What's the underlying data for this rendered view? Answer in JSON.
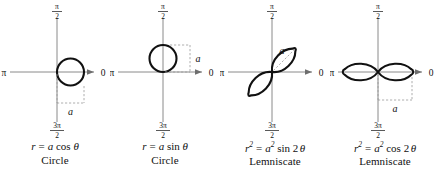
{
  "figure": {
    "background_color": "#ffffff",
    "curve_color": "#111111",
    "axis_color": "#8a8a8a",
    "dimension_color": "#9a9a9a"
  },
  "axis_labels": {
    "right": "0",
    "left": "π",
    "top_numerator": "π",
    "top_denominator": "2",
    "bottom_numerator": "3π",
    "bottom_denominator": "2",
    "dimension": "a"
  },
  "panels": [
    {
      "id": "circle-cos",
      "equation_plain": "r = a cos θ",
      "equation": {
        "lhs": "r",
        "lhs_exp": "",
        "equals": "=",
        "coef": "a",
        "coef_exp": "",
        "func": "cos",
        "arg": "θ",
        "multiplier": ""
      },
      "name": "Circle",
      "curve_type": "circle",
      "orientation": "right",
      "dimension_label": "a",
      "dimension_placement": "below-horizontal"
    },
    {
      "id": "circle-sin",
      "equation_plain": "r = a sin θ",
      "equation": {
        "lhs": "r",
        "lhs_exp": "",
        "equals": "=",
        "coef": "a",
        "coef_exp": "",
        "func": "sin",
        "arg": "θ",
        "multiplier": ""
      },
      "name": "Circle",
      "curve_type": "circle",
      "orientation": "up",
      "dimension_label": "a",
      "dimension_placement": "right-vertical"
    },
    {
      "id": "lemniscate-sin",
      "equation_plain": "r² = a² sin 2θ",
      "equation": {
        "lhs": "r",
        "lhs_exp": "2",
        "equals": "=",
        "coef": "a",
        "coef_exp": "2",
        "func": "sin",
        "arg": "θ",
        "multiplier": "2"
      },
      "name": "Lemniscate",
      "curve_type": "lemniscate",
      "orientation": "diagonal-45",
      "dimension_label": "a",
      "dimension_placement": "diagonal-inside-lobe"
    },
    {
      "id": "lemniscate-cos",
      "equation_plain": "r² = a² cos 2θ",
      "equation": {
        "lhs": "r",
        "lhs_exp": "2",
        "equals": "=",
        "coef": "a",
        "coef_exp": "2",
        "func": "cos",
        "arg": "θ",
        "multiplier": "2"
      },
      "name": "Lemniscate",
      "curve_type": "lemniscate",
      "orientation": "horizontal",
      "dimension_label": "a",
      "dimension_placement": "below-horizontal"
    }
  ]
}
